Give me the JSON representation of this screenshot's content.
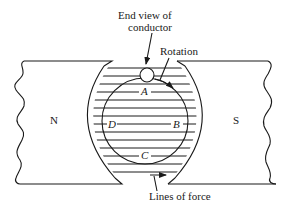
{
  "diagram": {
    "type": "generator-armature-in-magnetic-field",
    "annotations": {
      "conductor": "End view of",
      "conductor_line2": "conductor",
      "rotation": "Rotation",
      "lines_of_force": "Lines of force"
    },
    "poles": {
      "north": "N",
      "south": "S"
    },
    "positions": {
      "top": "A",
      "right": "B",
      "bottom": "C",
      "left": "D"
    },
    "colors": {
      "ink": "#1a1a1a",
      "background": "#ffffff"
    }
  }
}
